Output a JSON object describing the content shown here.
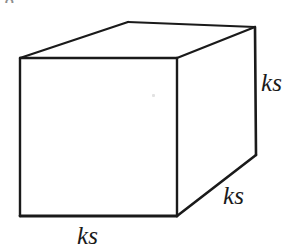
{
  "figure": {
    "type": "geometric-diagram",
    "background_color": "#ffffff",
    "stroke_color": "#1a1a1a",
    "labels": {
      "depth_right": "ks",
      "depth_front": "ks",
      "width_bottom": "ks"
    },
    "artifact": {
      "top_left_partial_glyph": "g"
    },
    "geometry": {
      "front_face": {
        "top_left": [
          20,
          58
        ],
        "top_right": [
          177,
          58
        ],
        "bottom_right": [
          177,
          216
        ],
        "bottom_left": [
          20,
          216
        ]
      },
      "back_face": {
        "top_left": [
          128,
          22
        ],
        "top_right": [
          255,
          27
        ],
        "bottom_right": [
          256,
          155
        ]
      },
      "edges": [
        {
          "name": "front-top",
          "from": [
            20,
            58
          ],
          "to": [
            177,
            58
          ]
        },
        {
          "name": "front-right",
          "from": [
            177,
            58
          ],
          "to": [
            177,
            216
          ]
        },
        {
          "name": "front-bottom",
          "from": [
            177,
            216
          ],
          "to": [
            20,
            216
          ]
        },
        {
          "name": "front-left",
          "from": [
            20,
            216
          ],
          "to": [
            20,
            58
          ]
        },
        {
          "name": "top-left-receding",
          "from": [
            20,
            58
          ],
          "to": [
            128,
            22
          ]
        },
        {
          "name": "back-top",
          "from": [
            128,
            22
          ],
          "to": [
            255,
            27
          ]
        },
        {
          "name": "top-right-receding",
          "from": [
            255,
            27
          ],
          "to": [
            177,
            58
          ]
        },
        {
          "name": "back-right-vertical",
          "from": [
            255,
            27
          ],
          "to": [
            256,
            155
          ]
        },
        {
          "name": "bottom-right-receding",
          "from": [
            256,
            155
          ],
          "to": [
            177,
            216
          ]
        }
      ]
    }
  }
}
